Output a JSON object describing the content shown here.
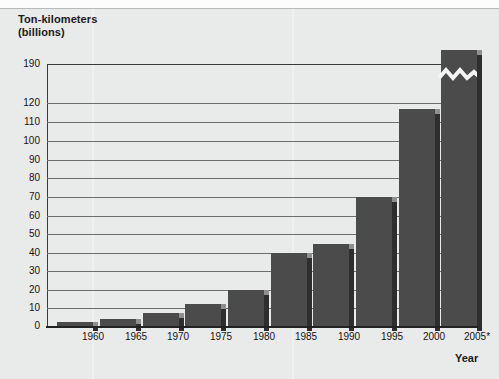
{
  "chart_data": {
    "type": "bar",
    "title": "",
    "ylabel_line1": "Ton-kilometers",
    "ylabel_line2": "(billions)",
    "xlabel": "Year",
    "categories": [
      "1960",
      "1965",
      "1970",
      "1975",
      "1980",
      "1985",
      "1990",
      "1995",
      "2000",
      "2005*"
    ],
    "values": [
      2,
      4,
      7,
      12,
      20,
      40,
      45,
      70,
      117,
      195
    ],
    "ytick_labels": [
      "190",
      "120",
      "110",
      "100",
      "90",
      "80",
      "70",
      "60",
      "50",
      "40",
      "30",
      "20",
      "10",
      "0"
    ],
    "ytick_values": [
      190,
      120,
      110,
      100,
      90,
      80,
      70,
      60,
      50,
      40,
      30,
      20,
      10,
      0
    ],
    "ylim": [
      0,
      120
    ],
    "axis_break": true,
    "axis_break_note": "Scale break between 120 and 190; last bar (2005*) is truncated by a zigzag break mark.",
    "grid": "horizontal",
    "legend": "none",
    "bar_color": "#4b4b4b",
    "bar_shadow_color": "#2e2e2e",
    "background_color": "#e9eaea",
    "gridline_color": "#6d6d6d",
    "axis_color": "#222222",
    "footnote_marker": "*"
  },
  "axes": {
    "y_title_line1": "Ton-kilometers",
    "y_title_line2": "(billions)",
    "x_title": "Year"
  },
  "yticks": [
    {
      "label": "190",
      "top": 0
    },
    {
      "label": "120",
      "top": 39
    },
    {
      "label": "110",
      "top": 58
    },
    {
      "label": "100",
      "top": 77
    },
    {
      "label": "90",
      "top": 96
    },
    {
      "label": "80",
      "top": 114
    },
    {
      "label": "70",
      "top": 133
    },
    {
      "label": "60",
      "top": 152
    },
    {
      "label": "50",
      "top": 170
    },
    {
      "label": "40",
      "top": 189
    },
    {
      "label": "30",
      "top": 207
    },
    {
      "label": "20",
      "top": 226
    },
    {
      "label": "10",
      "top": 244
    },
    {
      "label": "0",
      "top": 262
    }
  ],
  "bars": [
    {
      "year": "1960",
      "value": 2,
      "left": 10,
      "width": 36,
      "top": 258
    },
    {
      "year": "1965",
      "value": 4,
      "left": 53,
      "width": 36,
      "top": 255
    },
    {
      "year": "1970",
      "value": 7,
      "left": 96,
      "width": 36,
      "top": 249
    },
    {
      "year": "1975",
      "value": 12,
      "left": 138,
      "width": 36,
      "top": 240
    },
    {
      "year": "1980",
      "value": 20,
      "left": 181,
      "width": 36,
      "top": 226
    },
    {
      "year": "1985",
      "value": 40,
      "left": 224,
      "width": 36,
      "top": 189
    },
    {
      "year": "1990",
      "value": 45,
      "left": 266,
      "width": 36,
      "top": 180
    },
    {
      "year": "1995",
      "value": 70,
      "left": 309,
      "width": 36,
      "top": 133
    },
    {
      "year": "2000",
      "value": 117,
      "left": 352,
      "width": 36,
      "top": 45
    },
    {
      "year": "2005*",
      "value": 195,
      "left": 394,
      "width": 36,
      "top": -14
    }
  ],
  "xticks": [
    {
      "label": "1960",
      "left": 28
    },
    {
      "label": "1965",
      "left": 71
    },
    {
      "label": "1970",
      "left": 113
    },
    {
      "label": "1975",
      "left": 156
    },
    {
      "label": "1980",
      "left": 199
    },
    {
      "label": "1985",
      "left": 241
    },
    {
      "label": "1990",
      "left": 284
    },
    {
      "label": "1995",
      "left": 327
    },
    {
      "label": "2000",
      "left": 369
    },
    {
      "label": "2005*",
      "left": 412
    }
  ]
}
